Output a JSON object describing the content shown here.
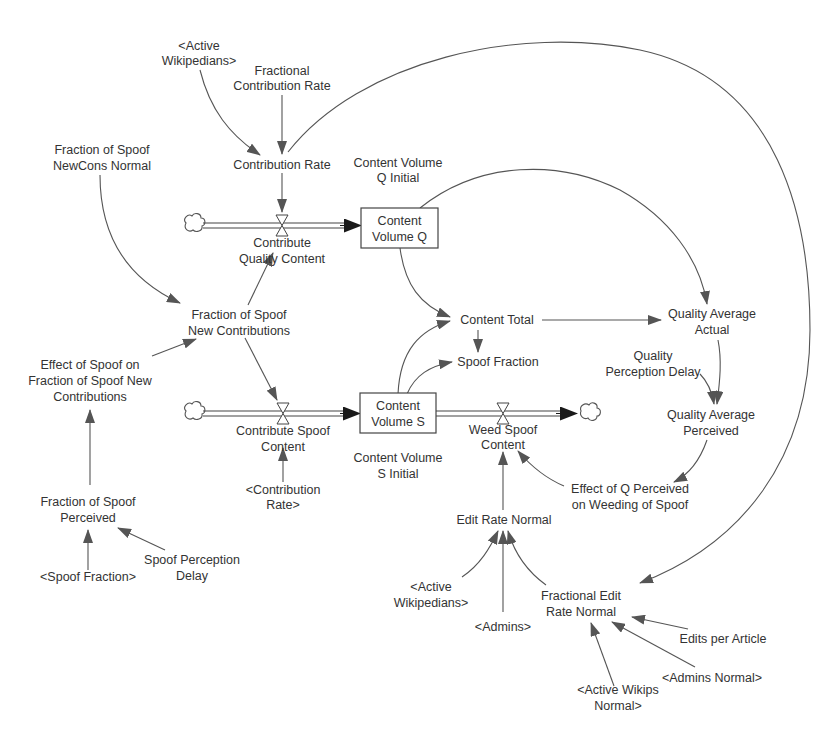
{
  "diagram": {
    "type": "stock-and-flow",
    "colors": {
      "line": "#555555",
      "text": "#333333",
      "background": "#ffffff"
    },
    "stocks": [
      {
        "id": "cvq",
        "label_lines": [
          "Content",
          "Volume Q"
        ]
      },
      {
        "id": "cvs",
        "label_lines": [
          "Content",
          "Volume S"
        ]
      }
    ],
    "flows": [
      {
        "id": "cqc",
        "label_lines": [
          "Contribute",
          "Quality Content"
        ],
        "from": "cloud",
        "to": "cvq"
      },
      {
        "id": "csc",
        "label_lines": [
          "Contribute Spoof",
          "Content"
        ],
        "from": "cloud",
        "to": "cvs"
      },
      {
        "id": "wsc",
        "label_lines": [
          "Weed Spoof",
          "Content"
        ],
        "from": "cvs",
        "to": "cloud"
      }
    ],
    "variables": [
      {
        "id": "aw1",
        "label_lines": [
          "<Active",
          "Wikipedians>"
        ]
      },
      {
        "id": "fcr",
        "label_lines": [
          "Fractional",
          "Contribution Rate"
        ]
      },
      {
        "id": "cr",
        "label_lines": [
          "Contribution Rate"
        ]
      },
      {
        "id": "fsnn",
        "label_lines": [
          "Fraction of Spoof",
          "NewCons Normal"
        ]
      },
      {
        "id": "cvqi",
        "label_lines": [
          "Content Volume",
          "Q Initial"
        ]
      },
      {
        "id": "fsnc",
        "label_lines": [
          "Fraction of Spoof",
          "New Contributions"
        ]
      },
      {
        "id": "esf",
        "label_lines": [
          "Effect of Spoof on",
          "Fraction of Spoof New",
          "Contributions"
        ]
      },
      {
        "id": "ct",
        "label_lines": [
          "Content Total"
        ]
      },
      {
        "id": "sf",
        "label_lines": [
          "Spoof Fraction"
        ]
      },
      {
        "id": "qaa",
        "label_lines": [
          "Quality Average",
          "Actual"
        ]
      },
      {
        "id": "qpd",
        "label_lines": [
          "Quality",
          "Perception Delay"
        ]
      },
      {
        "id": "qap",
        "label_lines": [
          "Quality Average",
          "Perceived"
        ]
      },
      {
        "id": "cvsi",
        "label_lines": [
          "Content Volume",
          "S Initial"
        ]
      },
      {
        "id": "crs",
        "label_lines": [
          "<Contribution",
          "Rate>"
        ]
      },
      {
        "id": "eqp",
        "label_lines": [
          "Effect of Q Perceived",
          "on Weeding of Spoof"
        ]
      },
      {
        "id": "ern",
        "label_lines": [
          "Edit Rate Normal"
        ]
      },
      {
        "id": "fsp",
        "label_lines": [
          "Fraction of Spoof",
          "Perceived"
        ]
      },
      {
        "id": "sfs",
        "label_lines": [
          "<Spoof Fraction>"
        ]
      },
      {
        "id": "spd",
        "label_lines": [
          "Spoof Perception",
          "Delay"
        ]
      },
      {
        "id": "aw2",
        "label_lines": [
          "<Active",
          "Wikipedians>"
        ]
      },
      {
        "id": "adm",
        "label_lines": [
          "<Admins>"
        ]
      },
      {
        "id": "fern",
        "label_lines": [
          "Fractional Edit",
          "Rate Normal"
        ]
      },
      {
        "id": "epa",
        "label_lines": [
          "Edits per Article"
        ]
      },
      {
        "id": "an",
        "label_lines": [
          "<Admins Normal>"
        ]
      },
      {
        "id": "awn",
        "label_lines": [
          "<Active Wikips",
          "Normal>"
        ]
      }
    ]
  }
}
